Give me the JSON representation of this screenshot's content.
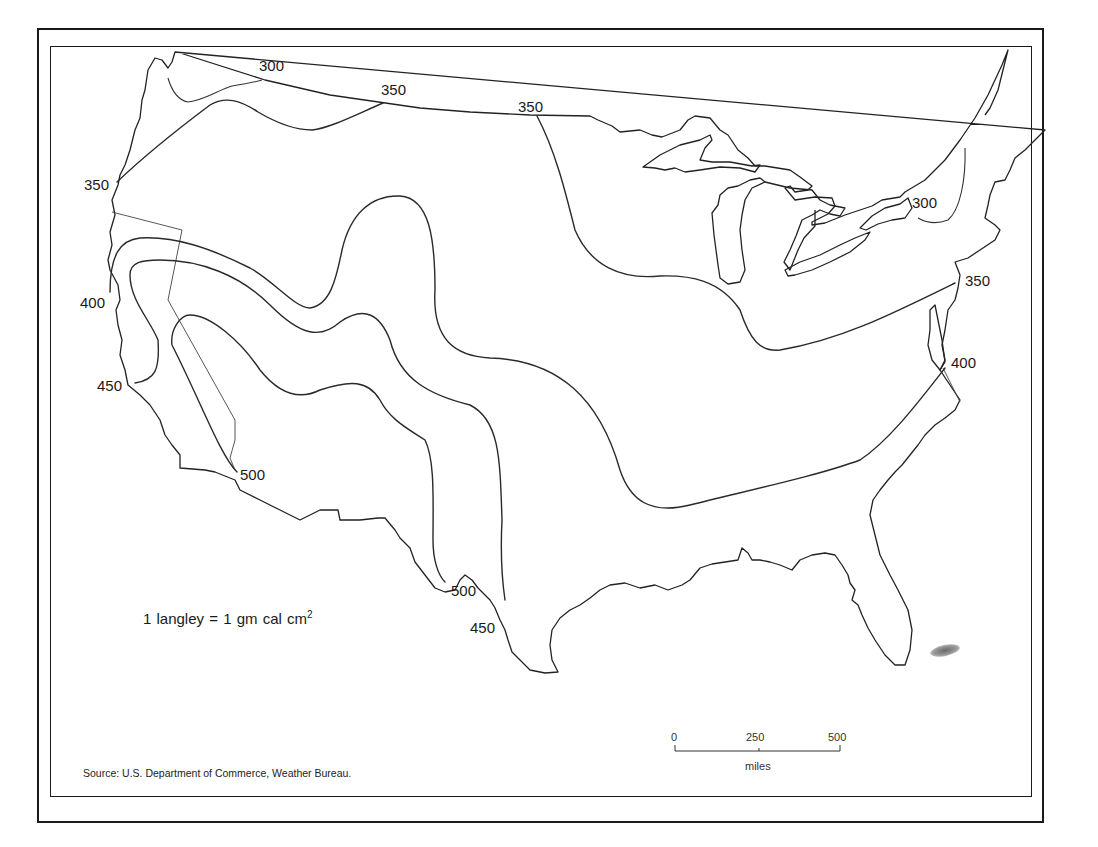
{
  "map": {
    "type": "isoline map",
    "region": "Contiguous United States",
    "units_note": {
      "lhs": "1 langley",
      "eq": "=",
      "rhs": "1 gm cal cm",
      "sup": "2"
    },
    "source": "Source: U.S. Department of Commerce, Weather Bureau.",
    "scale_bar": {
      "ticks": [
        "0",
        "250",
        "500"
      ],
      "unit": "miles"
    },
    "contour_labels": [
      {
        "value": "300",
        "location": "Pacific Northwest border"
      },
      {
        "value": "350",
        "location": "Northern border, Montana"
      },
      {
        "value": "350",
        "location": "Northern border, Minnesota"
      },
      {
        "value": "350",
        "location": "Oregon coast"
      },
      {
        "value": "300",
        "location": "New York / Lake Ontario"
      },
      {
        "value": "350",
        "location": "New Jersey coast"
      },
      {
        "value": "400",
        "location": "Northern California coast"
      },
      {
        "value": "400",
        "location": "Virginia coast"
      },
      {
        "value": "450",
        "location": "Central California coast"
      },
      {
        "value": "500",
        "location": "Southern California / Mexico border"
      },
      {
        "value": "500",
        "location": "Texas Big Bend"
      },
      {
        "value": "450",
        "location": "Texas Rio Grande"
      }
    ],
    "contour_values": [
      "300",
      "350",
      "400",
      "450",
      "500"
    ]
  },
  "colors": {
    "background": "#ffffff",
    "ink": "#1a1a1a",
    "smudge": "#777777"
  }
}
